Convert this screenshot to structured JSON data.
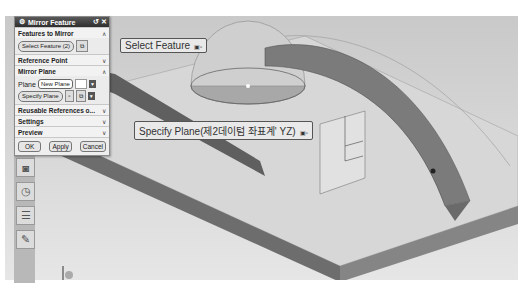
{
  "dialog": {
    "title": "Mirror Feature",
    "title_icons": [
      "gear-icon",
      "reset-icon",
      "close-icon"
    ],
    "sections": {
      "features_to_mirror": {
        "label": "Features to Mirror",
        "state": "expanded",
        "select_button": "Select Feature (2)"
      },
      "reference_point": {
        "label": "Reference Point",
        "state": "collapsed"
      },
      "mirror_plane": {
        "label": "Mirror Plane",
        "state": "expanded",
        "plane_label": "Plane",
        "plane_value": "New Plane",
        "specify_button": "Specify Plane"
      },
      "reusable_references": {
        "label": "Reusable References o...",
        "state": "collapsed"
      },
      "settings": {
        "label": "Settings",
        "state": "collapsed"
      },
      "preview": {
        "label": "Preview",
        "state": "collapsed"
      }
    },
    "buttons": {
      "ok": "OK",
      "apply": "Apply",
      "cancel": "Cancel"
    },
    "chevron_expanded": "∧",
    "chevron_collapsed": "∨"
  },
  "viewport": {
    "labels": {
      "select_feature": "Select Feature",
      "specify_plane": "Specify Plane(제2데이텀 좌표계' YZ)",
      "mouse_hint": "▣▫"
    }
  },
  "resource_bar": {
    "icons": [
      "part-navigator-icon",
      "history-icon",
      "reuse-library-icon",
      "drawing-icon"
    ]
  }
}
